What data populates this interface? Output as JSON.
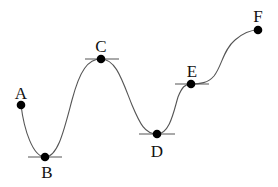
{
  "diagram": {
    "type": "curve-with-critical-points",
    "colors": {
      "curve": "#555555",
      "point": "#000000",
      "label": "#111111",
      "background": "#ffffff"
    },
    "points": [
      {
        "id": "A",
        "label": "A",
        "x": 21,
        "y": 105,
        "label_x": 21,
        "label_y": 99,
        "tangent": false
      },
      {
        "id": "B",
        "label": "B",
        "x": 45,
        "y": 157,
        "label_x": 47,
        "label_y": 178,
        "tangent": true,
        "tangent_x1": 28,
        "tangent_x2": 62
      },
      {
        "id": "C",
        "label": "C",
        "x": 101,
        "y": 59,
        "label_x": 101,
        "label_y": 52,
        "tangent": true,
        "tangent_x1": 85,
        "tangent_x2": 119
      },
      {
        "id": "D",
        "label": "D",
        "x": 157,
        "y": 134,
        "label_x": 157,
        "label_y": 157,
        "tangent": true,
        "tangent_x1": 139,
        "tangent_x2": 175
      },
      {
        "id": "E",
        "label": "E",
        "x": 191,
        "y": 84,
        "label_x": 192,
        "label_y": 77,
        "tangent": true,
        "tangent_x1": 175,
        "tangent_x2": 209
      },
      {
        "id": "F",
        "label": "F",
        "x": 258,
        "y": 30,
        "label_x": 258,
        "label_y": 22,
        "tangent": false
      }
    ]
  }
}
